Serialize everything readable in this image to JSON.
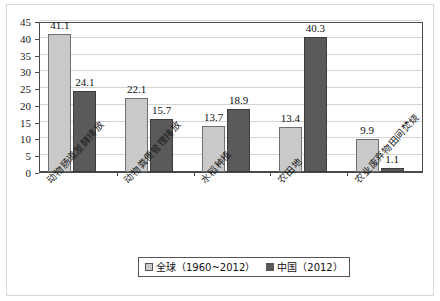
{
  "chart_data": {
    "type": "bar",
    "title": "",
    "subtitle": "",
    "xlabel": "",
    "ylabel": "",
    "ylim": [
      0,
      45
    ],
    "ytick_step": 5,
    "yticks": [
      "0",
      "5",
      "10",
      "15",
      "20",
      "25",
      "30",
      "35",
      "40",
      "45"
    ],
    "grid": true,
    "legend_position": "bottom-center",
    "categories": [
      "动物肠道发酵排放",
      "动物粪便管理排放",
      "水稻种植",
      "农田地",
      "农业废弃物田间焚烧"
    ],
    "series": [
      {
        "name": "全球（1960~2012）",
        "color": "#c9c9c9",
        "values": [
          41.1,
          22.1,
          13.7,
          13.4,
          9.9
        ],
        "labels": [
          "41.1",
          "22.1",
          "13.7",
          "13.4",
          "9.9"
        ]
      },
      {
        "name": "中国（2012）",
        "color": "#5a5a5a",
        "values": [
          24.1,
          15.7,
          18.9,
          40.3,
          1.1
        ],
        "labels": [
          "24.1",
          "15.7",
          "18.9",
          "40.3",
          "1.1"
        ]
      }
    ]
  },
  "legend": {
    "items": [
      {
        "label": "全球（1960~2012）",
        "swatch": "global"
      },
      {
        "label": "中国（2012）",
        "swatch": "china"
      }
    ]
  }
}
